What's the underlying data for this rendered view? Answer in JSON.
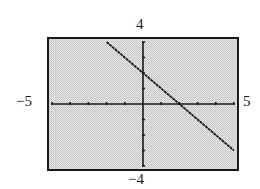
{
  "figure": {
    "part_label": ")",
    "window": {
      "xmin_label": "−5",
      "xmax_label": "5",
      "ymin_label": "−4",
      "ymax_label": "4"
    },
    "colors": {
      "background": "#d9d9d9",
      "line": "#1a1a1a",
      "axes": "#1a1a1a",
      "frame": "#1a1a1a"
    }
  },
  "chart_data": {
    "type": "line",
    "title": "",
    "xlabel": "",
    "ylabel": "",
    "xlim": [
      -5,
      5
    ],
    "ylim": [
      -4,
      4
    ],
    "xscl": 1,
    "yscl": 1,
    "grid": false,
    "axis_labels": {
      "left": "−5",
      "right": "5",
      "bottom": "−4",
      "top": "4"
    },
    "series": [
      {
        "name": "y = -x + 2",
        "x": [
          -2,
          -1,
          0,
          1,
          2,
          3,
          4,
          5
        ],
        "y": [
          4,
          3,
          2,
          1,
          0,
          -1,
          -2,
          -3
        ]
      }
    ],
    "annotations": []
  }
}
